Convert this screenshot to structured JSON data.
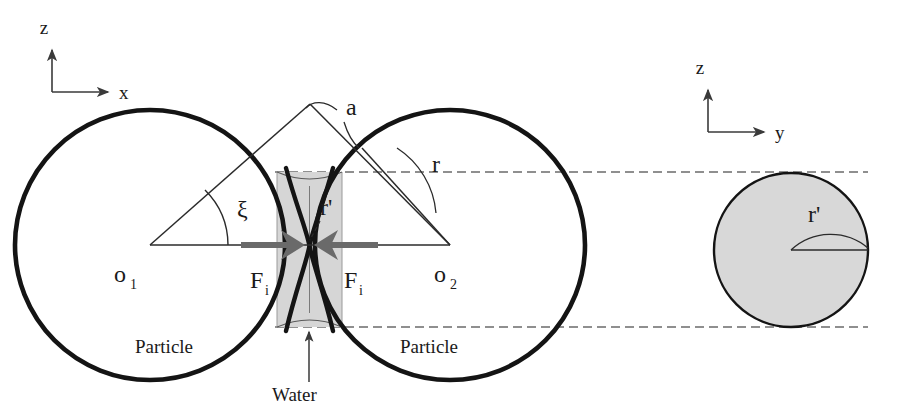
{
  "figure": {
    "background_color": "#ffffff",
    "width": 899,
    "height": 410
  },
  "colors": {
    "outline": "#141414",
    "thin_line": "#3a3a3a",
    "dashed_line": "#6b6b6b",
    "force_arrow": "#6a6a6a",
    "water_fill": "#d6d6d6",
    "sphere_fill": "#d8d8d8",
    "text": "#1a1a1a"
  },
  "axes_left": {
    "name": "left-coordinate-axes",
    "vertical_label": "z",
    "horizontal_label": "x",
    "origin_x": 52,
    "origin_y": 92,
    "vertical_length": 45,
    "horizontal_length": 60
  },
  "axes_right": {
    "name": "right-coordinate-axes",
    "vertical_label": "z",
    "horizontal_label": "y",
    "origin_x": 708,
    "origin_y": 132,
    "vertical_length": 45,
    "horizontal_length": 60
  },
  "particles": [
    {
      "id": "particle-left",
      "center_label": "o",
      "center_subscript": "1",
      "cx": 150,
      "cy": 245,
      "r": 135,
      "caption": "Particle",
      "caption_x": 135,
      "caption_y": 353
    },
    {
      "id": "particle-right",
      "center_label": "o",
      "center_subscript": "2",
      "cx": 450,
      "cy": 245,
      "r": 135,
      "caption": "Particle",
      "caption_x": 400,
      "caption_y": 353
    }
  ],
  "water_bridge": {
    "name": "water-bridge-region",
    "label": "Water",
    "label_x": 272,
    "label_y": 396,
    "left_x": 277,
    "right_x": 342,
    "top_y": 172,
    "bottom_y": 327,
    "fill": "#d6d6d6"
  },
  "forces": [
    {
      "id": "force-left",
      "label": "F",
      "subscript": "i",
      "label_x": 254,
      "label_y": 288,
      "direction": "right"
    },
    {
      "id": "force-right",
      "label": "F",
      "subscript": "i",
      "label_x": 344,
      "label_y": 288,
      "direction": "left"
    }
  ],
  "annotations": {
    "apex_label": {
      "name": "half-separation-label-a",
      "text": "a",
      "x": 346,
      "y": 115
    },
    "radius_label": {
      "name": "particle-radius-label-r",
      "text": "r",
      "x": 432,
      "y": 172
    },
    "meniscus_radius_label": {
      "name": "meniscus-radius-label-r-prime",
      "text": "r'",
      "x": 320,
      "y": 215
    },
    "angle_label": {
      "name": "half-filling-angle-xi",
      "text": "ξ",
      "x": 237,
      "y": 217
    }
  },
  "cross_section": {
    "name": "bridge-cross-section-circle",
    "cx": 791,
    "cy": 250,
    "r": 77,
    "radius_label": "r'",
    "radius_label_x": 808,
    "radius_label_y": 222,
    "fill": "#d8d8d8"
  },
  "dashed_lines": [
    {
      "name": "upper-projection-line",
      "x1": 275,
      "y1": 172,
      "x2": 868,
      "y2": 172
    },
    {
      "name": "lower-projection-line",
      "x1": 275,
      "y1": 327,
      "x2": 868,
      "y2": 327
    }
  ]
}
